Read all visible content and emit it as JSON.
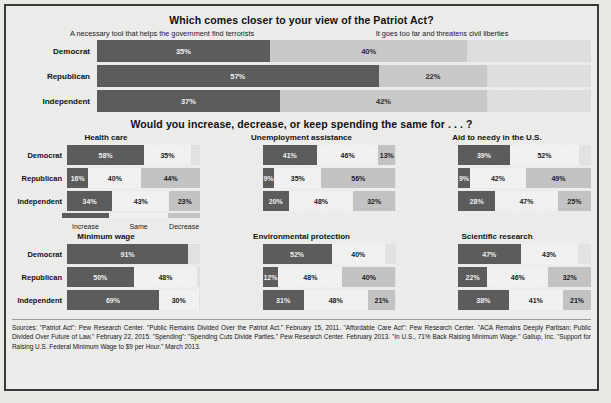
{
  "section1": {
    "title": "Which comes closer to your view of the Patriot Act?",
    "option_a": "A necessary tool that helps the government find terrorists",
    "option_b": "It goes too far and threatens civil liberties",
    "rows": [
      {
        "label": "Democrat",
        "a": "35%",
        "b": "40%"
      },
      {
        "label": "Republican",
        "a": "57%",
        "b": "22%"
      },
      {
        "label": "Independent",
        "a": "37%",
        "b": "42%"
      }
    ]
  },
  "section2": {
    "title": "Would you increase, decrease, or keep spending the same for . . . ?",
    "legend": [
      "Increase",
      "Same",
      "Decrease"
    ],
    "row_labels": [
      "Democrat",
      "Republican",
      "Independent"
    ],
    "charts": [
      {
        "title": "Health care",
        "rows": [
          {
            "label": "Democrat",
            "increase": "58%",
            "same": "35%",
            "decrease": ""
          },
          {
            "label": "Republican",
            "increase": "16%",
            "same": "40%",
            "decrease": "44%"
          },
          {
            "label": "Independent",
            "increase": "34%",
            "same": "43%",
            "decrease": "23%"
          }
        ]
      },
      {
        "title": "Unemployment assistance",
        "rows": [
          {
            "label": "Democrat",
            "increase": "41%",
            "same": "46%",
            "decrease": "13%"
          },
          {
            "label": "Republican",
            "increase": "9%",
            "same": "35%",
            "decrease": "56%"
          },
          {
            "label": "Independent",
            "increase": "20%",
            "same": "48%",
            "decrease": "32%"
          }
        ]
      },
      {
        "title": "Aid to needy in the U.S.",
        "rows": [
          {
            "label": "Democrat",
            "increase": "39%",
            "same": "52%",
            "decrease": ""
          },
          {
            "label": "Republican",
            "increase": "9%",
            "same": "42%",
            "decrease": "49%"
          },
          {
            "label": "Independent",
            "increase": "28%",
            "same": "47%",
            "decrease": "25%"
          }
        ]
      },
      {
        "title": "Minimum wage",
        "rows": [
          {
            "label": "Democrat",
            "increase": "91%",
            "same": "",
            "decrease": ""
          },
          {
            "label": "Republican",
            "increase": "50%",
            "same": "48%",
            "decrease": ""
          },
          {
            "label": "Independent",
            "increase": "69%",
            "same": "30%",
            "decrease": ""
          }
        ]
      },
      {
        "title": "Environmental protection",
        "rows": [
          {
            "label": "Democrat",
            "increase": "52%",
            "same": "40%",
            "decrease": ""
          },
          {
            "label": "Republican",
            "increase": "12%",
            "same": "48%",
            "decrease": "40%"
          },
          {
            "label": "Independent",
            "increase": "31%",
            "same": "48%",
            "decrease": "21%"
          }
        ]
      },
      {
        "title": "Scientific research",
        "rows": [
          {
            "label": "Democrat",
            "increase": "47%",
            "same": "43%",
            "decrease": ""
          },
          {
            "label": "Republican",
            "increase": "22%",
            "same": "46%",
            "decrease": "32%"
          },
          {
            "label": "Independent",
            "increase": "38%",
            "same": "41%",
            "decrease": "21%"
          }
        ]
      }
    ]
  },
  "sources": "Sources: \"Patriot Act\": Pew Research Center. \"Public Remains Divided Over the Patriot Act.\" February 15, 2011. \"Affordable Care Act\": Pew Research Center. \"ACA Remains Deeply Partisan; Public Divided Over Future of Law.\" February 22, 2015. \"Spending\": \"Spending Cuts Divide Parties.\" Pew Research Center. February 2013. \"In U.S., 71% Back Raising Minimum Wage.\" Gallup, Inc. \"Support for Raising U.S. Federal Minimum Wage to $9 per Hour.\" March 2013.",
  "colors": {
    "dark": "#5c5c5c",
    "light": "#c9c9c9",
    "same": "#f1f1f1",
    "decrease": "#c3c3c3",
    "background": "#ececeb"
  },
  "chart_data": [
    {
      "type": "bar",
      "title": "Which comes closer to your view of the Patriot Act?",
      "orientation": "horizontal",
      "stacked": true,
      "categories": [
        "Democrat",
        "Republican",
        "Independent"
      ],
      "series": [
        {
          "name": "A necessary tool that helps the government find terrorists",
          "values": [
            35,
            57,
            37
          ]
        },
        {
          "name": "It goes too far and threatens civil liberties",
          "values": [
            40,
            22,
            42
          ]
        }
      ],
      "xlabel": "",
      "ylabel": "",
      "xlim": [
        0,
        100
      ],
      "grid": false,
      "legend": "top"
    },
    {
      "type": "bar",
      "title": "Health care",
      "orientation": "horizontal",
      "stacked": true,
      "categories": [
        "Democrat",
        "Republican",
        "Independent"
      ],
      "series": [
        {
          "name": "Increase",
          "values": [
            58,
            16,
            34
          ]
        },
        {
          "name": "Same",
          "values": [
            35,
            40,
            43
          ]
        },
        {
          "name": "Decrease",
          "values": [
            null,
            44,
            23
          ]
        }
      ],
      "xlim": [
        0,
        100
      ],
      "grid": false,
      "legend": "bottom"
    },
    {
      "type": "bar",
      "title": "Unemployment assistance",
      "orientation": "horizontal",
      "stacked": true,
      "categories": [
        "Democrat",
        "Republican",
        "Independent"
      ],
      "series": [
        {
          "name": "Increase",
          "values": [
            41,
            9,
            20
          ]
        },
        {
          "name": "Same",
          "values": [
            46,
            35,
            48
          ]
        },
        {
          "name": "Decrease",
          "values": [
            13,
            56,
            32
          ]
        }
      ],
      "xlim": [
        0,
        100
      ],
      "grid": false,
      "legend": "bottom"
    },
    {
      "type": "bar",
      "title": "Aid to needy in the U.S.",
      "orientation": "horizontal",
      "stacked": true,
      "categories": [
        "Democrat",
        "Republican",
        "Independent"
      ],
      "series": [
        {
          "name": "Increase",
          "values": [
            39,
            9,
            28
          ]
        },
        {
          "name": "Same",
          "values": [
            52,
            42,
            47
          ]
        },
        {
          "name": "Decrease",
          "values": [
            null,
            49,
            25
          ]
        }
      ],
      "xlim": [
        0,
        100
      ],
      "grid": false,
      "legend": "bottom"
    },
    {
      "type": "bar",
      "title": "Minimum wage",
      "orientation": "horizontal",
      "stacked": true,
      "categories": [
        "Democrat",
        "Republican",
        "Independent"
      ],
      "series": [
        {
          "name": "Increase",
          "values": [
            91,
            50,
            69
          ]
        },
        {
          "name": "Same",
          "values": [
            null,
            48,
            30
          ]
        },
        {
          "name": "Decrease",
          "values": [
            null,
            null,
            null
          ]
        }
      ],
      "xlim": [
        0,
        100
      ],
      "grid": false,
      "legend": "bottom"
    },
    {
      "type": "bar",
      "title": "Environmental protection",
      "orientation": "horizontal",
      "stacked": true,
      "categories": [
        "Democrat",
        "Republican",
        "Independent"
      ],
      "series": [
        {
          "name": "Increase",
          "values": [
            52,
            12,
            31
          ]
        },
        {
          "name": "Same",
          "values": [
            40,
            48,
            48
          ]
        },
        {
          "name": "Decrease",
          "values": [
            null,
            40,
            21
          ]
        }
      ],
      "xlim": [
        0,
        100
      ],
      "grid": false,
      "legend": "bottom"
    },
    {
      "type": "bar",
      "title": "Scientific research",
      "orientation": "horizontal",
      "stacked": true,
      "categories": [
        "Democrat",
        "Republican",
        "Independent"
      ],
      "series": [
        {
          "name": "Increase",
          "values": [
            47,
            22,
            38
          ]
        },
        {
          "name": "Same",
          "values": [
            43,
            46,
            41
          ]
        },
        {
          "name": "Decrease",
          "values": [
            null,
            32,
            21
          ]
        }
      ],
      "xlim": [
        0,
        100
      ],
      "grid": false,
      "legend": "bottom"
    }
  ]
}
